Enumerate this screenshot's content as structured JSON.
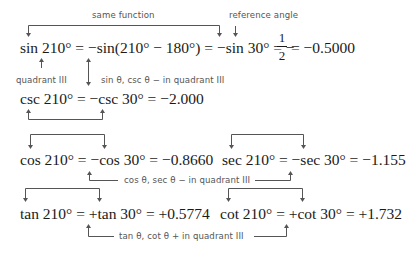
{
  "annotations": {
    "same_function": "same function",
    "reference_angle": "reference angle",
    "quadrant_iii": "quadrant III",
    "sin_csc_sign": "sin θ, csc θ − in quadrant III",
    "cos_sec_sign": "cos θ, sec θ − in quadrant III",
    "tan_cot_sign": "tan θ, cot θ + in quadrant III"
  },
  "equations": {
    "sin": {
      "lhs": "sin 210° = −sin(210° − 180°) = −sin 30° = −",
      "frac_num": "1",
      "frac_den": "2",
      "result": "= −0.5000"
    },
    "csc": "csc 210° = −csc 30° = −2.000",
    "cos": "cos 210° = −cos 30° = −0.8660",
    "sec": "sec 210° = −sec 30° = −1.155",
    "tan": "tan 210° = +tan 30° = +0.5774",
    "cot": "cot 210° = +cot 30° = +1.732"
  },
  "colors": {
    "text": "#1a1a1a",
    "annotation": "#555555",
    "background": "#ffffff"
  }
}
